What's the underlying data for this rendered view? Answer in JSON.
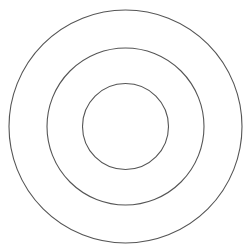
{
  "diagram": {
    "type": "concentric-circles",
    "circle_count": 3,
    "rings": [
      {
        "name": "outer"
      },
      {
        "name": "middle"
      },
      {
        "name": "inner"
      }
    ],
    "stroke_color": "#555555",
    "background_color": "#ffffff"
  }
}
